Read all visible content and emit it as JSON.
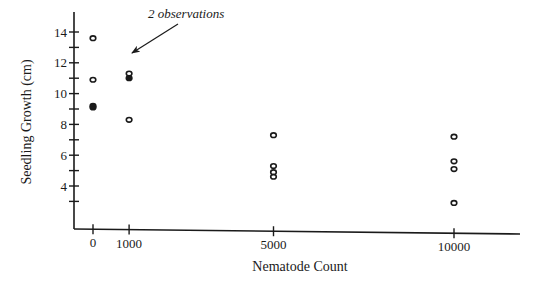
{
  "chart_data": {
    "type": "scatter",
    "title": "",
    "xlabel": "Nematode Count",
    "ylabel": "Seedling Growth (cm)",
    "x_ticks": [
      0,
      1000,
      5000,
      10000
    ],
    "x_tick_labels": [
      "0",
      "1000",
      "5000",
      "10000"
    ],
    "y_ticks": [
      3,
      4,
      5,
      6,
      7,
      8,
      9,
      10,
      11,
      12,
      13,
      14
    ],
    "y_tick_labels": [
      "",
      "4",
      "",
      "6",
      "",
      "8",
      "",
      "10",
      "",
      "12",
      "",
      "14"
    ],
    "ylim": [
      1.2,
      15.2
    ],
    "xlim": [
      -500,
      11800
    ],
    "grid": false,
    "legend": null,
    "series": [
      {
        "name": "observations",
        "points": [
          {
            "x": 0,
            "y": 13.6
          },
          {
            "x": 0,
            "y": 10.9
          },
          {
            "x": 0,
            "y": 9.2
          },
          {
            "x": 0,
            "y": 9.1
          },
          {
            "x": 1000,
            "y": 11.3
          },
          {
            "x": 1000,
            "y": 11.0
          },
          {
            "x": 1000,
            "y": 11.0
          },
          {
            "x": 1000,
            "y": 8.3
          },
          {
            "x": 5000,
            "y": 7.3
          },
          {
            "x": 5000,
            "y": 5.3
          },
          {
            "x": 5000,
            "y": 4.9
          },
          {
            "x": 5000,
            "y": 4.6
          },
          {
            "x": 10000,
            "y": 7.2
          },
          {
            "x": 10000,
            "y": 5.6
          },
          {
            "x": 10000,
            "y": 5.1
          },
          {
            "x": 10000,
            "y": 2.9
          }
        ]
      }
    ],
    "annotations": [
      {
        "text": "2 observations",
        "points_to": {
          "x": 1000,
          "y": 11.0
        }
      }
    ]
  },
  "labels": {
    "xlabel": "Nematode Count",
    "ylabel": "Seedling Growth (cm)",
    "annotation": "2 observations"
  }
}
